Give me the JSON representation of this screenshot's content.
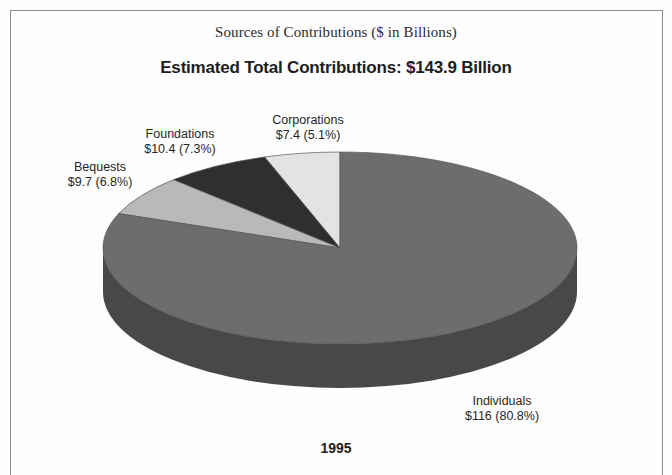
{
  "figure": {
    "title": "Sources of Contributions ($ in Billions)",
    "subtitle": "Estimated Total Contributions: $143.9 Billion",
    "year": "1995"
  },
  "labels": {
    "corporations": {
      "name": "Corporations",
      "value_line": "$7.4 (5.1%)"
    },
    "foundations": {
      "name": "Foundations",
      "value_line": "$10.4 (7.3%)"
    },
    "bequests": {
      "name": "Bequests",
      "value_line": "$9.7 (6.8%)"
    },
    "individuals": {
      "name": "Individuals",
      "value_line": "$116 (80.8%)"
    }
  },
  "chart_data": {
    "type": "pie",
    "title": "Sources of Contributions ($ in Billions)",
    "subtitle": "Estimated Total Contributions: $143.9 Billion",
    "year": "1995",
    "units": "$ Billions",
    "total": 143.9,
    "legend": "none",
    "labels_position": "outside",
    "three_d": true,
    "start_angle_deg": 90,
    "direction": "counterclockwise",
    "categories": [
      "Corporations",
      "Foundations",
      "Bequests",
      "Individuals"
    ],
    "values": [
      7.4,
      10.4,
      9.7,
      116
    ],
    "percentages": [
      5.1,
      7.3,
      6.8,
      80.8
    ],
    "value_labels": [
      "$7.4 (5.1%)",
      "$10.4 (7.3%)",
      "$9.7 (6.8%)",
      "$116 (80.8%)"
    ],
    "colors": [
      "#e3e3e3",
      "#2f2f2f",
      "#b9b9b9",
      "#6d6d6d"
    ],
    "side_colors": [
      "#bdbdbd",
      "#1e1e1e",
      "#949494",
      "#484848"
    ],
    "slices": [
      {
        "name": "Corporations",
        "value": 7.4,
        "percent": 5.1,
        "label": "$7.4 (5.1%)",
        "color": "#e3e3e3"
      },
      {
        "name": "Foundations",
        "value": 10.4,
        "percent": 7.3,
        "label": "$10.4 (7.3%)",
        "color": "#2f2f2f"
      },
      {
        "name": "Bequests",
        "value": 9.7,
        "percent": 6.8,
        "label": "$9.7 (6.8%)",
        "color": "#b9b9b9"
      },
      {
        "name": "Individuals",
        "value": 116,
        "percent": 80.8,
        "label": "$116 (80.8%)",
        "color": "#6d6d6d"
      }
    ]
  },
  "geometry": {
    "cx": 340,
    "cy": 248,
    "rx": 237,
    "ry": 96,
    "depth": 44
  }
}
